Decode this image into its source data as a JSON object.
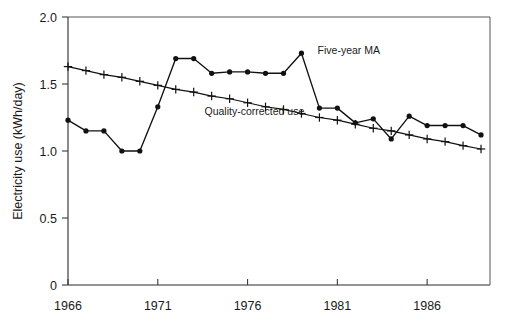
{
  "chart_data": {
    "type": "line",
    "title": "",
    "subtitle": "",
    "xlabel": "",
    "ylabel": "Electricity use (kWh/day)",
    "xlim": [
      1966,
      1989.5
    ],
    "ylim": [
      0,
      2.0
    ],
    "grid": false,
    "legend_position": "inline-annotations",
    "y_ticks": [
      "0",
      "0.5",
      "1.0",
      "1.5",
      "2.0"
    ],
    "y_tick_values": [
      0,
      0.5,
      1.0,
      1.5,
      2.0
    ],
    "x_ticks": [
      "1966",
      "1971",
      "1976",
      "1981",
      "1986"
    ],
    "x_tick_values": [
      1966,
      1971,
      1976,
      1981,
      1986
    ],
    "x": [
      1966,
      1967,
      1968,
      1969,
      1970,
      1971,
      1972,
      1973,
      1974,
      1975,
      1976,
      1977,
      1978,
      1979,
      1980,
      1981,
      1982,
      1983,
      1984,
      1985,
      1986,
      1987,
      1988,
      1989
    ],
    "series": [
      {
        "name": "Five-year MA",
        "marker": "filled-circle",
        "values": [
          1.23,
          1.15,
          1.15,
          1.0,
          1.0,
          1.33,
          1.69,
          1.69,
          1.58,
          1.59,
          1.59,
          1.58,
          1.58,
          1.73,
          1.32,
          1.32,
          1.21,
          1.24,
          1.09,
          1.26,
          1.19,
          1.19,
          1.19,
          1.12
        ]
      },
      {
        "name": "Quality-corrected use",
        "marker": "plus",
        "values": [
          1.63,
          1.6,
          1.57,
          1.55,
          1.52,
          1.49,
          1.46,
          1.44,
          1.41,
          1.39,
          1.36,
          1.33,
          1.31,
          1.28,
          1.25,
          1.23,
          1.2,
          1.17,
          1.15,
          1.12,
          1.09,
          1.07,
          1.04,
          1.015
        ]
      }
    ],
    "annotations": [
      {
        "text": "Five-year MA",
        "x": 1979.9,
        "y": 1.755
      },
      {
        "text": "Quality-corrected use",
        "x": 1973.6,
        "y": 1.295
      }
    ]
  }
}
